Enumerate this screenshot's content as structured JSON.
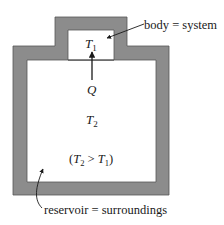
{
  "diagram": {
    "type": "thermodynamic-system-reservoir",
    "labels": {
      "body_label": "body = system",
      "reservoir_label": "reservoir = surroundings",
      "t1": "T",
      "t1_sub": "1",
      "t2": "T",
      "t2_sub": "2",
      "heat": "Q",
      "condition_open": "(",
      "condition_t2": "T",
      "condition_t2_sub": "2",
      "condition_op": " > ",
      "condition_t1": "T",
      "condition_t1_sub": "1",
      "condition_close": ")"
    },
    "colors": {
      "wall": "#8c8c8c",
      "wall_edge": "#555555",
      "interior": "#ffffff",
      "text": "#1a1a1a"
    }
  }
}
